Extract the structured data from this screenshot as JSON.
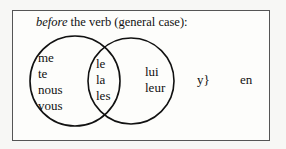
{
  "diagram": {
    "title_italic": "before",
    "title_rest": " the verb (general case):",
    "left_only": [
      "me",
      "te",
      "nous",
      "vous"
    ],
    "intersection": [
      "le",
      "la",
      "les"
    ],
    "right_only": [
      "lui",
      "leur"
    ],
    "y_label": "y}",
    "en_label": "en",
    "colors": {
      "stroke": "#111111",
      "border": "#555555",
      "background": "#fdfdfb"
    }
  }
}
